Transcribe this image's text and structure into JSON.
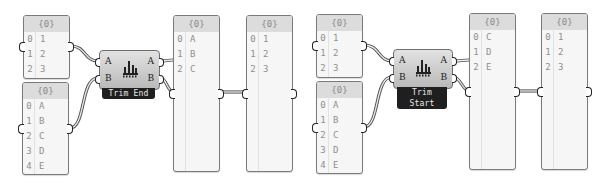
{
  "canvas": {
    "background": "#ffffff"
  },
  "groups": [
    {
      "component": {
        "name": "Trim End",
        "inputs": [
          "A",
          "B"
        ],
        "outputs": [
          "A",
          "B"
        ],
        "icon": "trim-tree-icon"
      },
      "input_panels": [
        {
          "header": "{0}",
          "rows": [
            {
              "i": "0",
              "v": "1"
            },
            {
              "i": "1",
              "v": "2"
            },
            {
              "i": "2",
              "v": "3"
            }
          ]
        },
        {
          "header": "{0}",
          "rows": [
            {
              "i": "0",
              "v": "A"
            },
            {
              "i": "1",
              "v": "B"
            },
            {
              "i": "2",
              "v": "C"
            },
            {
              "i": "3",
              "v": "D"
            },
            {
              "i": "4",
              "v": "E"
            }
          ]
        }
      ],
      "output_panels": [
        {
          "header": "{0}",
          "rows": [
            {
              "i": "0",
              "v": "A"
            },
            {
              "i": "1",
              "v": "B"
            },
            {
              "i": "2",
              "v": "C"
            }
          ]
        },
        {
          "header": "{0}",
          "rows": [
            {
              "i": "0",
              "v": "1"
            },
            {
              "i": "1",
              "v": "2"
            },
            {
              "i": "2",
              "v": "3"
            }
          ]
        }
      ]
    },
    {
      "component": {
        "name": "Trim Start",
        "inputs": [
          "A",
          "B"
        ],
        "outputs": [
          "A",
          "B"
        ],
        "icon": "trim-tree-icon"
      },
      "input_panels": [
        {
          "header": "{0}",
          "rows": [
            {
              "i": "0",
              "v": "1"
            },
            {
              "i": "1",
              "v": "2"
            },
            {
              "i": "2",
              "v": "3"
            }
          ]
        },
        {
          "header": "{0}",
          "rows": [
            {
              "i": "0",
              "v": "A"
            },
            {
              "i": "1",
              "v": "B"
            },
            {
              "i": "2",
              "v": "C"
            },
            {
              "i": "3",
              "v": "D"
            },
            {
              "i": "4",
              "v": "E"
            }
          ]
        }
      ],
      "output_panels": [
        {
          "header": "{0}",
          "rows": [
            {
              "i": "0",
              "v": "C"
            },
            {
              "i": "1",
              "v": "D"
            },
            {
              "i": "2",
              "v": "E"
            }
          ]
        },
        {
          "header": "{0}",
          "rows": [
            {
              "i": "0",
              "v": "1"
            },
            {
              "i": "1",
              "v": "2"
            },
            {
              "i": "2",
              "v": "3"
            }
          ]
        }
      ]
    }
  ]
}
